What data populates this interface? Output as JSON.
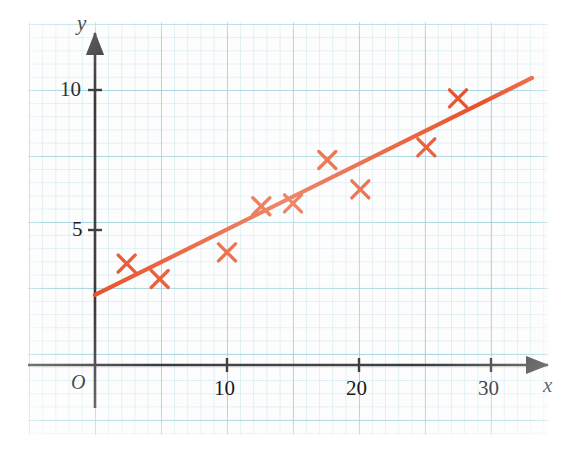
{
  "figure": {
    "background_color": "#ffffff",
    "grid_color": "#96cddc",
    "grid_minor_color": "#b9dee8",
    "axis_color": "#3a3a3c",
    "marker_color": "#e8532a",
    "line_color": "#e8532a"
  },
  "chart_data": {
    "type": "scatter",
    "title": "",
    "xlabel": "x",
    "ylabel": "y",
    "xlim": [
      0,
      34.5
    ],
    "ylim": [
      0,
      11.7
    ],
    "grid": true,
    "legend": false,
    "origin_label": "O",
    "xticks": [
      10,
      20,
      30
    ],
    "xtick_labels": [
      "10",
      "20",
      "30"
    ],
    "yticks": [
      5,
      10
    ],
    "ytick_labels": [
      "5",
      "10"
    ],
    "points": [
      {
        "x": 2.4,
        "y": 3.8
      },
      {
        "x": 4.9,
        "y": 3.25
      },
      {
        "x": 10.0,
        "y": 4.2
      },
      {
        "x": 12.6,
        "y": 5.85
      },
      {
        "x": 15.0,
        "y": 5.95
      },
      {
        "x": 17.6,
        "y": 7.5
      },
      {
        "x": 20.1,
        "y": 6.45
      },
      {
        "x": 25.1,
        "y": 7.95
      },
      {
        "x": 27.5,
        "y": 9.7
      }
    ],
    "trend_line": {
      "name": "line of best fit",
      "x_start": 0.0,
      "y_start": 2.68,
      "x_end": 33.1,
      "y_end": 10.43
    }
  },
  "labels": {
    "y_axis": "y",
    "x_axis": "x",
    "origin": "O",
    "x_10": "10",
    "x_20": "20",
    "x_30": "30",
    "y_5": "5",
    "y_10": "10"
  }
}
